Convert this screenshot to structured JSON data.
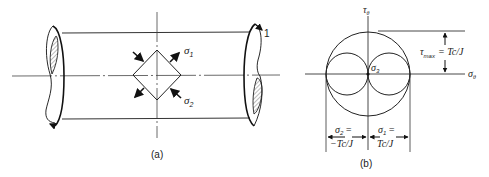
{
  "figure_a": {
    "caption": "(a)",
    "label_end": "1",
    "sigma1": "σ",
    "sigma1_sub": "1",
    "sigma2": "σ",
    "sigma2_sub": "2"
  },
  "figure_b": {
    "caption": "(b)",
    "y_axis_label": "τ",
    "y_axis_sub": "θ",
    "x_axis_label": "σ",
    "x_axis_sub": "θ",
    "center_label": "σ",
    "center_sub": "3",
    "tau_max_label": "τ",
    "tau_max_sub": "max",
    "tau_max_value": "= Tc/J",
    "sigma2_label": "σ",
    "sigma2_sub": "2",
    "sigma2_eq": "=",
    "sigma2_value": "−Tc/J",
    "sigma1_label": "σ",
    "sigma1_sub": "1",
    "sigma1_eq": "=",
    "sigma1_value": "Tc/J"
  }
}
